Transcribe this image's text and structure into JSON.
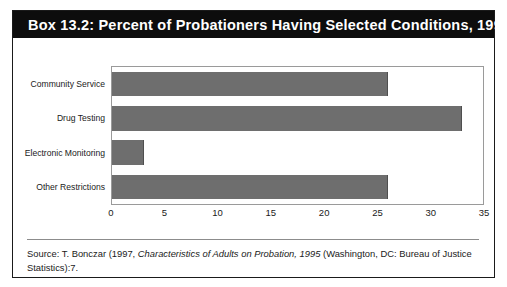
{
  "box": {
    "title": "Box 13.2: Percent of Probationers Having Selected Conditions, 1995"
  },
  "source": {
    "prefix": "Source: T. Bonczar (1997, ",
    "italic_title": "Characteristics of Adults on Probation, 1995",
    "suffix": " (Washington, DC: Bureau of Justice Statistics):7."
  },
  "colors": {
    "header_background": "#0d0d0d",
    "header_text": "#ffffff",
    "bar_fill": "#6e6e6e",
    "plot_border": "#9a9a9a",
    "box_border": "#1a1a1a"
  },
  "chart_data": {
    "type": "bar",
    "orientation": "horizontal",
    "title": "Box 13.2: Percent of Probationers Having Selected Conditions, 1995",
    "xlabel": "",
    "ylabel": "",
    "categories": [
      "Community Service",
      "Drug Testing",
      "Electronic Monitoring",
      "Other Restrictions"
    ],
    "values": [
      26,
      33,
      3,
      26
    ],
    "xlim": [
      0,
      35
    ],
    "xticks": [
      0,
      5,
      10,
      15,
      20,
      25,
      30,
      35
    ],
    "grid": false,
    "legend": false
  }
}
